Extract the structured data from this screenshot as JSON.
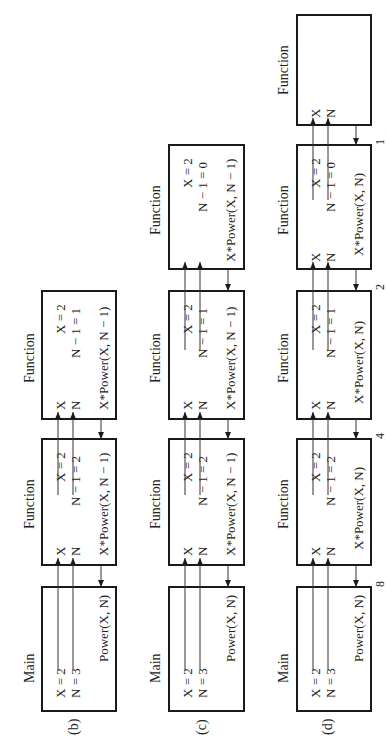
{
  "figure": {
    "rows": [
      {
        "label": "(b)",
        "main": {
          "title": "Main",
          "lines": [
            "X = 2",
            "N = 3"
          ],
          "call": "Power(X, N)"
        },
        "functions": [
          {
            "title": "Function",
            "params": [
              "X",
              "N"
            ],
            "values": [
              "X = 2",
              "N − 1 = 2"
            ],
            "expr": "X*Power(X, N − 1)"
          },
          {
            "title": "Function",
            "params": [
              "X",
              "N"
            ],
            "values": [
              "X = 2",
              "N − 1 = 1"
            ],
            "expr": "X*Power(X, N − 1)"
          }
        ]
      },
      {
        "label": "(c)",
        "main": {
          "title": "Main",
          "lines": [
            "X = 2",
            "N = 3"
          ],
          "call": "Power(X, N)"
        },
        "functions": [
          {
            "title": "Function",
            "params": [
              "X",
              "N"
            ],
            "values": [
              "X = 2",
              "N − 1 = 2"
            ],
            "expr": "X*Power(X, N − 1)"
          },
          {
            "title": "Function",
            "params": [
              "X",
              "N"
            ],
            "values": [
              "X = 2",
              "N − 1 = 1"
            ],
            "expr": "X*Power(X, N − 1)"
          },
          {
            "title": "Function",
            "params": [
              "X",
              "N"
            ],
            "values": [
              "X = 2",
              "N − 1 = 0"
            ],
            "expr": "X*Power(X, N − 1)"
          }
        ]
      },
      {
        "label": "(d)",
        "main": {
          "title": "Main",
          "lines": [
            "X = 2",
            "N = 3"
          ],
          "call": "Power(X, N)"
        },
        "functions": [
          {
            "title": "Function",
            "params": [
              "X",
              "N"
            ],
            "values": [
              "X = 2",
              "N − 1 = 2"
            ],
            "expr": "X*Power(X, N)"
          },
          {
            "title": "Function",
            "params": [
              "X",
              "N"
            ],
            "values": [
              "X = 2",
              "N − 1 = 1"
            ],
            "expr": "X*Power(X, N)"
          },
          {
            "title": "Function",
            "params": [
              "X",
              "N"
            ],
            "values": [
              "X = 2",
              "N − 1 = 0"
            ],
            "expr": "X*Power(X, N)"
          },
          {
            "title": "Function",
            "params": [
              "X",
              "N"
            ],
            "values": [],
            "expr": ""
          }
        ],
        "return_values": [
          "8",
          "4",
          "2",
          "1"
        ]
      }
    ]
  }
}
